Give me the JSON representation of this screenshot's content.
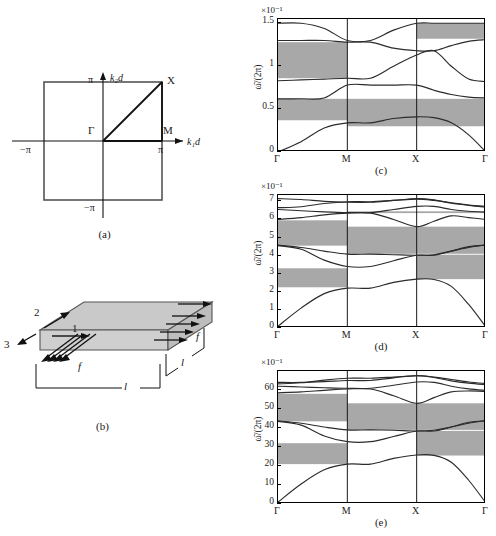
{
  "figure": {
    "panels": [
      {
        "id": "a",
        "caption": "(a)"
      },
      {
        "id": "b",
        "caption": "(b)"
      },
      {
        "id": "c",
        "caption": "(c)"
      },
      {
        "id": "d",
        "caption": "(d)"
      },
      {
        "id": "e",
        "caption": "(e)"
      }
    ]
  },
  "panel_a": {
    "caption": "(a)",
    "xaxis_label": "k₁d",
    "yaxis_label": "k₂d",
    "tick_x_pos": "π",
    "tick_x_neg": "−π",
    "tick_y_pos": "π",
    "tick_y_neg": "−π",
    "points": [
      {
        "name": "Γ",
        "label": "Γ"
      },
      {
        "name": "M",
        "label": "M"
      },
      {
        "name": "X",
        "label": "X"
      }
    ]
  },
  "panel_b": {
    "caption": "(b)",
    "axis_labels": [
      "1",
      "2",
      "3"
    ],
    "force_label": "f",
    "length_label": "l",
    "labels": {
      "dir1": "1",
      "dir2": "2",
      "dir3": "3",
      "force_front": "f",
      "force_right": "f",
      "len_bottom": "l",
      "len_right": "l"
    }
  },
  "chart_data": [
    {
      "type": "line",
      "panel": "c",
      "title": "(c)",
      "xlabel": "",
      "ylabel": "ω̄/(2π)",
      "exponent": "×10⁻¹",
      "x_ticks": [
        "Γ",
        "M",
        "X",
        "Γ"
      ],
      "x_tick_positions": [
        0,
        1,
        2,
        3
      ],
      "y_ticks": [
        0,
        0.5,
        1,
        1.5
      ],
      "ylim": [
        0,
        1.55
      ],
      "grid": false,
      "legend": "none",
      "band_gaps": [
        {
          "low": 0.37,
          "high": 0.62,
          "segments": "Γ-M"
        },
        {
          "low": 0.3,
          "high": 0.62,
          "segments": "M-X"
        },
        {
          "low": 0.3,
          "high": 0.62,
          "segments": "X-Γ"
        },
        {
          "low": 0.86,
          "high": 1.28,
          "segments": "Γ-M"
        },
        {
          "low": 1.32,
          "high": 1.5,
          "segments": "X-Γ"
        }
      ],
      "series": [
        {
          "name": "band-1",
          "values": [
            0.0,
            0.12,
            0.28,
            0.34,
            0.34,
            0.39,
            0.41,
            0.4,
            0.34,
            0.2,
            0.0
          ]
        },
        {
          "name": "band-2",
          "values": [
            0.62,
            0.62,
            0.63,
            0.78,
            0.78,
            0.78,
            0.78,
            0.72,
            0.67,
            0.64,
            0.63
          ]
        },
        {
          "name": "band-3",
          "values": [
            0.83,
            0.84,
            0.85,
            0.86,
            0.86,
            1.0,
            1.13,
            1.18,
            1.0,
            0.85,
            0.82
          ]
        },
        {
          "name": "band-4",
          "values": [
            1.3,
            1.3,
            1.3,
            1.28,
            1.28,
            1.21,
            1.18,
            1.18,
            1.24,
            1.29,
            1.31
          ]
        },
        {
          "name": "band-5",
          "values": [
            1.5,
            1.5,
            1.44,
            1.3,
            1.3,
            1.42,
            1.5,
            1.5,
            1.5,
            1.5,
            1.5
          ]
        }
      ]
    },
    {
      "type": "line",
      "panel": "d",
      "title": "(d)",
      "xlabel": "",
      "ylabel": "ω̄/(2π)",
      "exponent": "×10⁻¹",
      "x_ticks": [
        "Γ",
        "M",
        "X",
        "Γ"
      ],
      "x_tick_positions": [
        0,
        1,
        2,
        3
      ],
      "y_ticks": [
        0,
        1,
        2,
        3,
        4,
        5,
        6,
        7
      ],
      "ylim": [
        0,
        7.35
      ],
      "grid": false,
      "legend": "none",
      "band_gaps": [
        {
          "low": 2.25,
          "high": 3.3,
          "segments": "Γ-M"
        },
        {
          "low": 2.7,
          "high": 4.05,
          "segments": "X-Γ"
        },
        {
          "low": 4.55,
          "high": 5.95,
          "segments": "Γ-M"
        },
        {
          "low": 4.1,
          "high": 5.6,
          "segments": "M-X"
        },
        {
          "low": 4.1,
          "high": 5.6,
          "segments": "X-Γ"
        },
        {
          "low": 6.35,
          "high": 6.45,
          "segments": "M-Γ"
        }
      ],
      "series": [
        {
          "name": "band-1",
          "values": [
            0.1,
            1.1,
            1.9,
            2.2,
            2.2,
            2.52,
            2.7,
            2.68,
            2.3,
            1.3,
            0.05
          ]
        },
        {
          "name": "band-2",
          "values": [
            4.55,
            4.35,
            3.75,
            3.4,
            3.4,
            3.72,
            4.02,
            4.02,
            4.25,
            4.5,
            4.58
          ]
        },
        {
          "name": "band-3",
          "values": [
            4.58,
            4.45,
            4.25,
            4.08,
            4.08,
            4.05,
            4.02,
            4.05,
            4.25,
            4.45,
            4.6
          ]
        },
        {
          "name": "band-4",
          "values": [
            6.0,
            6.1,
            6.25,
            6.35,
            6.35,
            6.0,
            5.6,
            5.9,
            6.2,
            6.1,
            6.0
          ]
        },
        {
          "name": "band-5",
          "values": [
            6.55,
            6.48,
            6.42,
            6.38,
            6.38,
            6.55,
            6.72,
            6.72,
            6.55,
            6.45,
            6.4
          ]
        },
        {
          "name": "band-6",
          "values": [
            6.65,
            6.7,
            6.88,
            6.98,
            6.98,
            7.05,
            7.12,
            7.05,
            6.92,
            6.8,
            6.72
          ]
        },
        {
          "name": "band-7",
          "values": [
            7.15,
            7.1,
            7.0,
            6.95,
            6.95,
            7.05,
            7.15,
            7.08,
            6.9,
            6.78,
            6.68
          ]
        }
      ]
    },
    {
      "type": "line",
      "panel": "e",
      "title": "(e)",
      "xlabel": "",
      "ylabel": "ω̄/(2π)",
      "exponent": "×10⁻¹",
      "x_ticks": [
        "Γ",
        "M",
        "X",
        "Γ"
      ],
      "x_tick_positions": [
        0,
        1,
        2,
        3
      ],
      "y_ticks": [
        0,
        10,
        20,
        30,
        40,
        50,
        60
      ],
      "ylim": [
        0,
        70
      ],
      "grid": false,
      "legend": "none",
      "band_gaps": [
        {
          "low": 21.0,
          "high": 32.0,
          "segments": "Γ-M"
        },
        {
          "low": 25.5,
          "high": 38.5,
          "segments": "X-Γ"
        },
        {
          "low": 43.5,
          "high": 58.0,
          "segments": "Γ-M"
        },
        {
          "low": 39.0,
          "high": 53.0,
          "segments": "M-X"
        },
        {
          "low": 39.0,
          "high": 53.0,
          "segments": "X-Γ"
        }
      ],
      "series": [
        {
          "name": "band-1",
          "values": [
            1.0,
            10.5,
            18.0,
            21.0,
            21.0,
            24.0,
            25.8,
            25.6,
            22.0,
            12.5,
            0.5
          ]
        },
        {
          "name": "band-2",
          "values": [
            43.5,
            41.5,
            35.8,
            32.8,
            32.8,
            35.5,
            38.4,
            38.4,
            40.5,
            43.0,
            43.8
          ]
        },
        {
          "name": "band-3",
          "values": [
            43.8,
            42.5,
            40.5,
            39.0,
            39.0,
            38.8,
            38.4,
            38.8,
            40.5,
            42.5,
            44.0
          ]
        },
        {
          "name": "band-4",
          "values": [
            58.5,
            59.0,
            59.8,
            60.5,
            60.5,
            57.0,
            53.0,
            56.0,
            59.0,
            59.5,
            59.2
          ]
        },
        {
          "name": "band-5",
          "values": [
            62.0,
            61.6,
            61.2,
            60.9,
            60.9,
            62.5,
            64.2,
            64.0,
            62.0,
            60.6,
            59.8
          ]
        },
        {
          "name": "band-6",
          "values": [
            63.2,
            63.8,
            65.2,
            66.2,
            66.2,
            66.8,
            67.5,
            66.8,
            65.5,
            64.2,
            63.4
          ]
        },
        {
          "name": "band-7",
          "values": [
            64.0,
            64.0,
            64.4,
            65.0,
            65.0,
            66.4,
            67.6,
            66.6,
            64.8,
            63.6,
            62.8
          ]
        }
      ]
    }
  ],
  "colors": {
    "gap_fill": "#a8a8a8",
    "band_line": "#2b2b2b",
    "axis": "#000000",
    "slab_top": "#c9c9c9",
    "slab_side": "#b5b5b5"
  }
}
